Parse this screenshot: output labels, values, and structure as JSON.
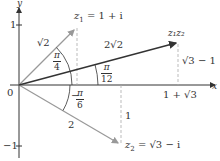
{
  "diagram": {
    "axes": {
      "x_label": "x",
      "y_label": "y",
      "origin_label": "0",
      "y_tick_pos": "1",
      "y_tick_neg": "−1"
    },
    "vectors": [
      {
        "name": "z1",
        "label_var": "z",
        "label_sub": "1",
        "label_rest": " = 1 + i",
        "modulus": "√2",
        "angle_num": "π",
        "angle_den": "4"
      },
      {
        "name": "z2",
        "label_var": "z",
        "label_sub": "2",
        "label_rest": " = √3 − i",
        "modulus": "2",
        "angle_prefix": "−",
        "angle_num": "π",
        "angle_den": "6"
      },
      {
        "name": "z1z2",
        "label": "z₁z₂",
        "modulus": "2√2",
        "angle_num": "π",
        "angle_den": "12"
      }
    ],
    "annotations": {
      "z1z2_height": "√3 − 1",
      "z1z2_x": "1 + √3",
      "z2_depth": "1"
    },
    "colors": {
      "axis": "#333333",
      "z1z2_vector": "#333333",
      "z1_z2_vectors": "#999999",
      "dashed": "#aaaaaa"
    }
  }
}
